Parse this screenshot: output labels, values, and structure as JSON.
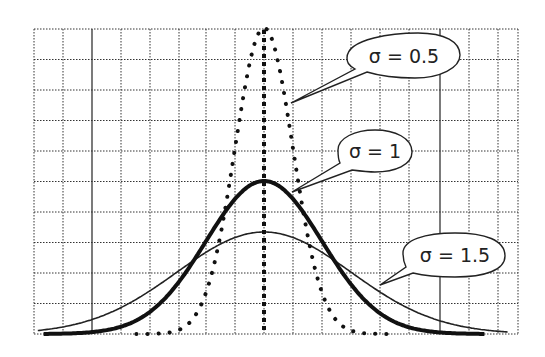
{
  "chart_data": {
    "type": "line",
    "title": "",
    "xlabel": "",
    "ylabel": "",
    "x_range": [
      -4,
      4
    ],
    "y_range": [
      0,
      0.8
    ],
    "grid": true,
    "grid_style": "dotted",
    "series": [
      {
        "name": "σ = 0.5",
        "sigma": 0.5,
        "mean": 0,
        "peak": 0.798,
        "style": "dotted",
        "label": "σ = 0.5"
      },
      {
        "name": "σ = 1",
        "sigma": 1,
        "mean": 0,
        "peak": 0.399,
        "style": "thick-solid",
        "label": "σ = 1"
      },
      {
        "name": "σ = 1.5",
        "sigma": 1.5,
        "mean": 0,
        "peak": 0.266,
        "style": "thin-solid",
        "label": "σ = 1.5"
      }
    ],
    "annotations": [
      {
        "text": "σ = 0.5",
        "type": "callout"
      },
      {
        "text": "σ = 1",
        "type": "callout"
      },
      {
        "text": "σ = 1.5",
        "type": "callout"
      }
    ],
    "mean_line": {
      "x": 0,
      "style": "dotted-vertical"
    }
  },
  "colors": {
    "line": "#111111",
    "grid": "#333333",
    "background": "#ffffff"
  }
}
